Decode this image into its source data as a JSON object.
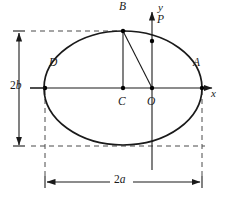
{
  "figure": {
    "type": "geometry-diagram",
    "colors": {
      "stroke": "#1a1a1a",
      "dashed": "#555555",
      "background": "#ffffff",
      "point_fill": "#000000"
    },
    "points": [
      {
        "id": "A",
        "label": "A",
        "x": 202,
        "y": 88,
        "label_x": 193,
        "label_y": 64,
        "marker": true
      },
      {
        "id": "B",
        "label": "B",
        "x": 123,
        "y": 31,
        "label_x": 119,
        "label_y": 8,
        "marker": true
      },
      {
        "id": "C",
        "label": "C",
        "x": 123,
        "y": 88,
        "label_x": 119,
        "label_y": 95,
        "marker": true
      },
      {
        "id": "D",
        "label": "D",
        "x": 45,
        "y": 88,
        "label_x": 49,
        "label_y": 64,
        "marker": true
      },
      {
        "id": "O",
        "label": "O",
        "x": 152,
        "y": 88,
        "label_x": 149,
        "label_y": 95,
        "marker": true
      },
      {
        "id": "P",
        "label": "P",
        "x": 152,
        "y": 41,
        "label_x": 157,
        "label_y": 20,
        "marker": true
      }
    ],
    "axes": {
      "x": {
        "label": "x",
        "label_x": 211,
        "label_y": 91
      },
      "y": {
        "label": "y",
        "label_x": 158,
        "label_y": 5
      }
    },
    "dimensions": [
      {
        "id": "height",
        "label": "2b",
        "letter": "b",
        "number": "2",
        "label_x": 8,
        "label_y": 81,
        "orientation": "vertical"
      },
      {
        "id": "width",
        "label": "2a",
        "letter": "a",
        "number": "2",
        "label_x": 115,
        "label_y": 173,
        "orientation": "horizontal"
      }
    ],
    "ellipse": {
      "cx": 123,
      "cy": 88,
      "rx": 79,
      "ry": 57
    },
    "segments": [
      {
        "id": "BC",
        "from": "B",
        "to": "C"
      },
      {
        "id": "BO",
        "from": "B",
        "to": "O"
      },
      {
        "id": "DA",
        "from": "D",
        "to": "A"
      }
    ]
  }
}
